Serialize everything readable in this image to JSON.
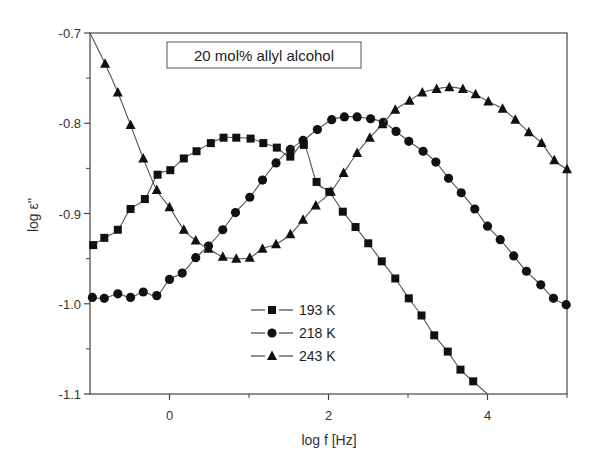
{
  "chart_data": {
    "type": "line",
    "title": "20 mol% allyl alcohol",
    "xlabel": "log f [Hz]",
    "ylabel": "log ε''",
    "xlim": [
      -1,
      5
    ],
    "ylim": [
      -1.1,
      -0.7
    ],
    "xticks": [
      0,
      2,
      4
    ],
    "xticks_minor": [
      1,
      3,
      5
    ],
    "yticks": [
      -0.7,
      -0.8,
      -0.9,
      -1.0,
      -1.1
    ],
    "ytick_labels": [
      "-0.7",
      "-0.8",
      "-0.9",
      "-1.0",
      "-1.1"
    ],
    "xtick_labels": [
      "0",
      "2",
      "4"
    ],
    "grid": false,
    "legend_position": "lower center",
    "series": [
      {
        "name": "193 K",
        "marker": "square",
        "x": [
          -0.96,
          -0.82,
          -0.65,
          -0.49,
          -0.31,
          -0.15,
          0.01,
          0.18,
          0.34,
          0.52,
          0.68,
          0.84,
          1.02,
          1.18,
          1.35,
          1.52,
          1.69,
          1.85,
          2.01,
          2.18,
          2.34,
          2.5,
          2.67,
          2.84,
          3.01,
          3.17,
          3.33,
          3.5,
          3.66,
          3.82
        ],
        "y": [
          -0.935,
          -0.927,
          -0.918,
          -0.895,
          -0.884,
          -0.857,
          -0.852,
          -0.839,
          -0.831,
          -0.822,
          -0.816,
          -0.816,
          -0.817,
          -0.822,
          -0.827,
          -0.837,
          -0.824,
          -0.865,
          -0.876,
          -0.898,
          -0.915,
          -0.933,
          -0.953,
          -0.972,
          -0.994,
          -1.013,
          -1.035,
          -1.053,
          -1.073,
          -1.086
        ]
      },
      {
        "name": "218 K",
        "marker": "circle",
        "x": [
          -0.97,
          -0.82,
          -0.65,
          -0.49,
          -0.33,
          -0.16,
          0.0,
          0.16,
          0.33,
          0.49,
          0.67,
          0.83,
          1.01,
          1.17,
          1.34,
          1.52,
          1.68,
          1.86,
          2.04,
          2.2,
          2.36,
          2.53,
          2.69,
          2.85,
          3.01,
          3.19,
          3.35,
          3.51,
          3.67,
          3.84,
          4.0,
          4.16,
          4.33,
          4.49,
          4.67,
          4.83,
          4.99
        ],
        "y": [
          -0.993,
          -0.994,
          -0.989,
          -0.993,
          -0.987,
          -0.991,
          -0.973,
          -0.966,
          -0.949,
          -0.936,
          -0.918,
          -0.899,
          -0.882,
          -0.863,
          -0.844,
          -0.829,
          -0.819,
          -0.807,
          -0.796,
          -0.793,
          -0.793,
          -0.795,
          -0.799,
          -0.809,
          -0.82,
          -0.831,
          -0.843,
          -0.861,
          -0.877,
          -0.895,
          -0.914,
          -0.929,
          -0.947,
          -0.964,
          -0.979,
          -0.994,
          -1.001
        ]
      },
      {
        "name": "243 K",
        "marker": "triangle",
        "x": [
          -0.81,
          -0.65,
          -0.49,
          -0.33,
          -0.16,
          0.0,
          0.18,
          0.33,
          0.49,
          0.67,
          0.84,
          1.01,
          1.17,
          1.34,
          1.52,
          1.68,
          1.84,
          2.03,
          2.19,
          2.36,
          2.52,
          2.68,
          2.84,
          3.02,
          3.18,
          3.36,
          3.52,
          3.69,
          3.85,
          4.01,
          4.19,
          4.35,
          4.52,
          4.68,
          4.84,
          5.0
        ],
        "y": [
          -0.734,
          -0.766,
          -0.802,
          -0.839,
          -0.874,
          -0.893,
          -0.918,
          -0.93,
          -0.939,
          -0.948,
          -0.95,
          -0.949,
          -0.939,
          -0.934,
          -0.923,
          -0.907,
          -0.891,
          -0.876,
          -0.855,
          -0.833,
          -0.816,
          -0.801,
          -0.785,
          -0.775,
          -0.766,
          -0.762,
          -0.76,
          -0.762,
          -0.768,
          -0.776,
          -0.784,
          -0.796,
          -0.81,
          -0.822,
          -0.841,
          -0.851
        ]
      }
    ]
  }
}
